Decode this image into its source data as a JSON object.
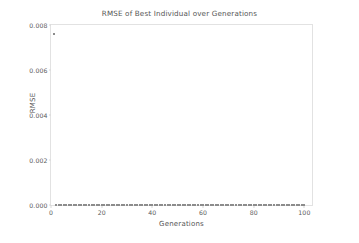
{
  "chart_data": {
    "type": "scatter",
    "title": "RMSE of Best Individual over Generations",
    "xlabel": "Generations",
    "ylabel": "RMSE",
    "xlim": [
      0,
      103
    ],
    "ylim": [
      0.0,
      0.008
    ],
    "xticks": [
      0,
      20,
      40,
      60,
      80,
      100
    ],
    "xtick_labels": [
      "0",
      "20",
      "40",
      "60",
      "80",
      "100"
    ],
    "yticks": [
      0.0,
      0.002,
      0.004,
      0.006,
      0.008
    ],
    "ytick_labels": [
      "0.000",
      "0.002",
      "0.004",
      "0.006",
      "0.008"
    ],
    "grid": false,
    "legend": false,
    "marker": "square",
    "marker_color": "#8c8c8c",
    "marker_size": 2,
    "frame_color": "#e2e2e2",
    "background": "#ffffff",
    "series": [
      {
        "name": "Best Individual RMSE",
        "x": [
          1,
          2,
          3,
          4,
          5,
          6,
          7,
          8,
          9,
          10,
          11,
          12,
          13,
          14,
          15,
          16,
          17,
          18,
          19,
          20,
          21,
          22,
          23,
          24,
          25,
          26,
          27,
          28,
          29,
          30,
          31,
          32,
          33,
          34,
          35,
          36,
          37,
          38,
          39,
          40,
          41,
          42,
          43,
          44,
          45,
          46,
          47,
          48,
          49,
          50,
          51,
          52,
          53,
          54,
          55,
          56,
          57,
          58,
          59,
          60,
          61,
          62,
          63,
          64,
          65,
          66,
          67,
          68,
          69,
          70,
          71,
          72,
          73,
          74,
          75,
          76,
          77,
          78,
          79,
          80,
          81,
          82,
          83,
          84,
          85,
          86,
          87,
          88,
          89,
          90,
          91,
          92,
          93,
          94,
          95,
          96,
          97,
          98,
          99,
          100
        ],
        "y": [
          0.00762,
          0.0,
          0.0,
          0.0,
          0.0,
          0.0,
          0.0,
          0.0,
          0.0,
          0.0,
          0.0,
          0.0,
          0.0,
          0.0,
          0.0,
          0.0,
          0.0,
          0.0,
          0.0,
          0.0,
          0.0,
          0.0,
          0.0,
          0.0,
          0.0,
          0.0,
          0.0,
          0.0,
          0.0,
          0.0,
          0.0,
          0.0,
          0.0,
          0.0,
          0.0,
          0.0,
          0.0,
          0.0,
          0.0,
          0.0,
          0.0,
          0.0,
          0.0,
          0.0,
          0.0,
          0.0,
          0.0,
          0.0,
          0.0,
          0.0,
          0.0,
          0.0,
          0.0,
          0.0,
          0.0,
          0.0,
          0.0,
          0.0,
          0.0,
          0.0,
          0.0,
          0.0,
          0.0,
          0.0,
          0.0,
          0.0,
          0.0,
          0.0,
          0.0,
          0.0,
          0.0,
          0.0,
          0.0,
          0.0,
          0.0,
          0.0,
          0.0,
          0.0,
          0.0,
          0.0,
          0.0,
          0.0,
          0.0,
          0.0,
          0.0,
          0.0,
          0.0,
          0.0,
          0.0,
          0.0,
          0.0,
          0.0,
          0.0,
          0.0,
          0.0,
          0.0,
          0.0,
          0.0,
          0.0,
          0.0
        ]
      }
    ]
  }
}
